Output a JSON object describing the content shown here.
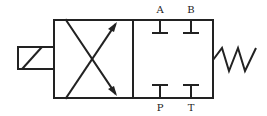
{
  "diagram": {
    "stroke_color": "#222222",
    "background": "#ffffff",
    "ports": {
      "top": [
        {
          "label": "A"
        },
        {
          "label": "B"
        }
      ],
      "bottom": [
        {
          "label": "P"
        },
        {
          "label": "T"
        }
      ]
    },
    "actuators": {
      "left": "solenoid",
      "right": "spring"
    },
    "envelopes": [
      {
        "position": "left",
        "flow": "crossed-arrows"
      },
      {
        "position": "right",
        "flow": "blocked-ports"
      }
    ]
  }
}
